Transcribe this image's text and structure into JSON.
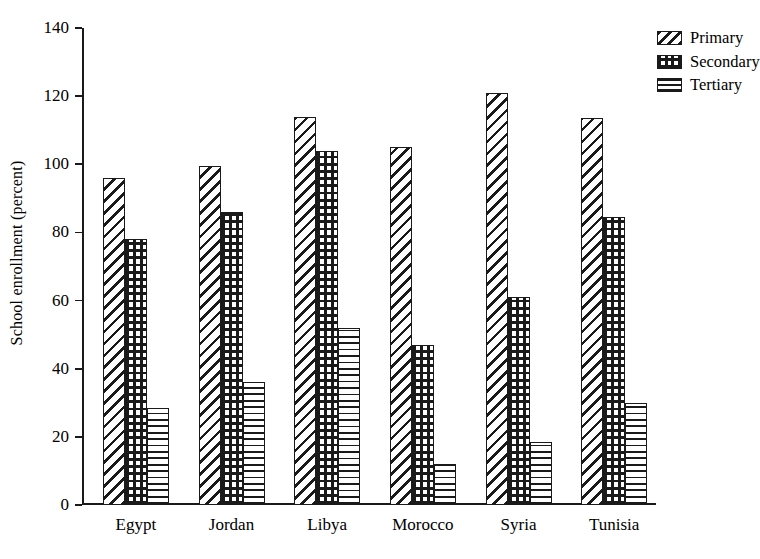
{
  "chart_data": {
    "type": "bar",
    "title": "",
    "xlabel": "",
    "ylabel": "School enrollment (percent)",
    "ylim": [
      0,
      140
    ],
    "yticks": [
      0,
      20,
      40,
      60,
      80,
      100,
      120,
      140
    ],
    "ytick_labels": [
      "0",
      "20",
      "40",
      "60",
      "80",
      "100",
      "120",
      "140"
    ],
    "grid": false,
    "legend_position": "top-right",
    "categories": [
      "Egypt",
      "Jordan",
      "Libya",
      "Morocco",
      "Syria",
      "Tunisia"
    ],
    "series": [
      {
        "name": "Primary",
        "pattern": "diagonal-hatch",
        "values": [
          96,
          99.5,
          114,
          105,
          121,
          113.5
        ]
      },
      {
        "name": "Secondary",
        "pattern": "cross-hatch-grid",
        "values": [
          78,
          86,
          104,
          47,
          61,
          84.5
        ]
      },
      {
        "name": "Tertiary",
        "pattern": "horizontal-lines",
        "values": [
          28.5,
          36,
          52,
          12,
          18.5,
          30
        ]
      }
    ]
  },
  "colors": {
    "ink": "#1a1a1a",
    "background": "#ffffff"
  }
}
